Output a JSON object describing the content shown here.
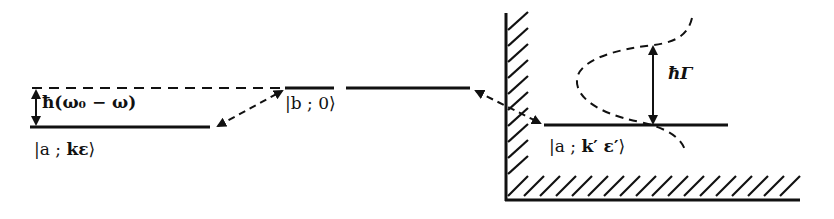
{
  "diagram": {
    "type": "energy-level-diagram",
    "colors": {
      "ink": "#111111",
      "background": "#ffffff"
    },
    "levels": [
      {
        "id": "initial",
        "label": "|a ; kε⟩",
        "label_parts": [
          "|a ; ",
          "kε",
          "⟩"
        ]
      },
      {
        "id": "intermediate",
        "label": "|b ; 0⟩"
      },
      {
        "id": "final",
        "label": "|a ; k′ ε′⟩",
        "label_parts": [
          "|a ; ",
          "k′ ε′",
          "⟩"
        ]
      }
    ],
    "detuning_label": "ħ(ω₀ − ω)",
    "width_label": "ħΓ",
    "transitions": [
      {
        "from": "initial",
        "to": "intermediate",
        "style": "dashed double arrow"
      },
      {
        "from": "intermediate",
        "to": "final",
        "style": "dashed double arrow"
      }
    ],
    "continuum": {
      "wall": "hatched vertical",
      "floor": "hatched horizontal"
    }
  }
}
